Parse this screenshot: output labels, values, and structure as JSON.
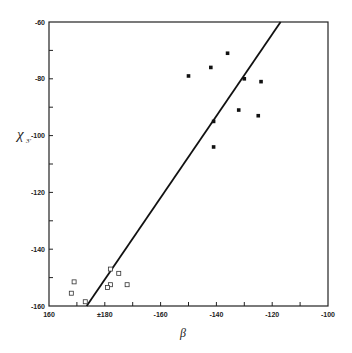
{
  "chart_data": {
    "type": "scatter",
    "title": "",
    "xlabel": "β",
    "ylabel": "χ3'",
    "ylabel_main": "χ",
    "ylabel_sub": "3'",
    "x_axis_note": "β is circular: axis runs 160 → ±180 → -100",
    "xlim_display": [
      160,
      260
    ],
    "ylim": [
      -160,
      -60
    ],
    "x_ticks": [
      {
        "pos": 160,
        "label": "160"
      },
      {
        "pos": 170,
        "label": ""
      },
      {
        "pos": 180,
        "label": "±180"
      },
      {
        "pos": 190,
        "label": ""
      },
      {
        "pos": 200,
        "label": "-160"
      },
      {
        "pos": 210,
        "label": ""
      },
      {
        "pos": 220,
        "label": "-140"
      },
      {
        "pos": 230,
        "label": ""
      },
      {
        "pos": 240,
        "label": "-120"
      },
      {
        "pos": 250,
        "label": ""
      },
      {
        "pos": 260,
        "label": "-100"
      }
    ],
    "y_ticks": [
      {
        "pos": -60,
        "label": "-60"
      },
      {
        "pos": -70,
        "label": ""
      },
      {
        "pos": -80,
        "label": "-80"
      },
      {
        "pos": -90,
        "label": ""
      },
      {
        "pos": -100,
        "label": "-100"
      },
      {
        "pos": -110,
        "label": ""
      },
      {
        "pos": -120,
        "label": "-120"
      },
      {
        "pos": -130,
        "label": ""
      },
      {
        "pos": -140,
        "label": "-140"
      },
      {
        "pos": -150,
        "label": ""
      },
      {
        "pos": -160,
        "label": "-160"
      }
    ],
    "grid": false,
    "legend": null,
    "series": [
      {
        "name": "filled squares",
        "marker": "filled-square",
        "points": [
          {
            "beta": -150,
            "chi": -79
          },
          {
            "beta": -142,
            "chi": -76
          },
          {
            "beta": -136,
            "chi": -71
          },
          {
            "beta": -130,
            "chi": -80
          },
          {
            "beta": -124,
            "chi": -81
          },
          {
            "beta": -132,
            "chi": -91
          },
          {
            "beta": -125,
            "chi": -93
          },
          {
            "beta": -141,
            "chi": -95
          },
          {
            "beta": -141,
            "chi": -104
          }
        ]
      },
      {
        "name": "open squares",
        "marker": "open-square",
        "points": [
          {
            "beta": 169,
            "chi": -151.5
          },
          {
            "beta": 168,
            "chi": -155.5
          },
          {
            "beta": 173,
            "chi": -158.5
          },
          {
            "beta": -178,
            "chi": -147
          },
          {
            "beta": -175,
            "chi": -148.5
          },
          {
            "beta": -172,
            "chi": -152.5
          },
          {
            "beta": -178,
            "chi": -152.5
          },
          {
            "beta": -179,
            "chi": -153.5
          }
        ]
      },
      {
        "name": "regression line",
        "marker": "line",
        "points": [
          {
            "beta": 173.5,
            "chi": -160
          },
          {
            "beta": -117,
            "chi": -60
          }
        ]
      }
    ]
  }
}
